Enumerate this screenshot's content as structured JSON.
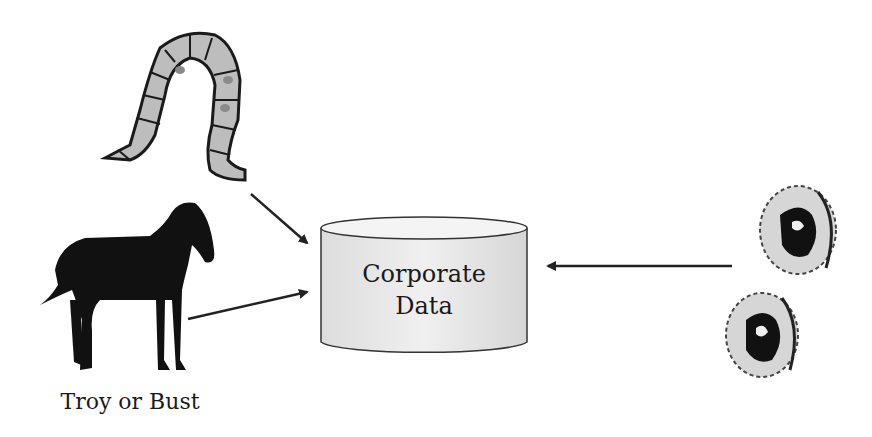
{
  "diagram": {
    "database": {
      "line1": "Corporate",
      "line2": "Data"
    },
    "horse_caption": "Troy or Bust",
    "sources": [
      "worm-icon",
      "horse-icon",
      "virus-icon",
      "virus-icon"
    ],
    "colors": {
      "stroke": "#222222",
      "fill_light": "#e8e8e8",
      "fill_mid": "#bdbdbd",
      "ink": "#111111"
    }
  }
}
